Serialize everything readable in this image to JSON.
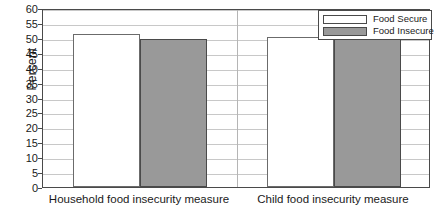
{
  "chart_data": {
    "type": "bar",
    "title": "",
    "xlabel": "",
    "ylabel": "Percent",
    "ylim": [
      0,
      60
    ],
    "ytick_step": 5,
    "yticks": [
      60,
      55,
      50,
      45,
      40,
      35,
      30,
      25,
      20,
      15,
      10,
      5,
      0
    ],
    "grid": true,
    "legend_position": "top-right",
    "categories": [
      "Household food insecurity measure",
      "Child food insecurity measure"
    ],
    "series": [
      {
        "name": "Food Secure",
        "values": [
          51.2,
          50.2
        ],
        "color": "#ffffff"
      },
      {
        "name": "Food Insecure",
        "values": [
          49.5,
          50.0
        ],
        "color": "#999999"
      }
    ]
  },
  "legend": {
    "items": [
      {
        "label": "Food Secure"
      },
      {
        "label": "Food Insecure"
      }
    ]
  },
  "colors": {
    "food_secure": "#ffffff",
    "food_insecure": "#999999",
    "frame": "#4a4a4a",
    "gridline": "#c8c8c8"
  }
}
